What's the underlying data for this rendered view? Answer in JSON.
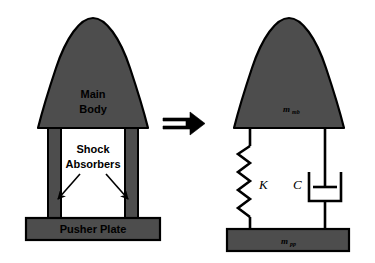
{
  "figure": {
    "background_color": "#ffffff",
    "body_fill_color": "#4d4d4d",
    "outline_color": "#000000"
  },
  "left_schematic": {
    "name": "physical-configuration",
    "main_body_label_line1": "Main",
    "main_body_label_line2": "Body",
    "shock_absorbers_label_line1": "Shock",
    "shock_absorbers_label_line2": "Absorbers",
    "pusher_plate_label": "Pusher Plate",
    "leg_count": 2,
    "arrow_count": 2
  },
  "equivalence": {
    "name": "implies-arrow",
    "symbol": "⇒"
  },
  "right_schematic": {
    "name": "lumped-mass-model",
    "main_body_mass_symbol": "m",
    "main_body_mass_subscript": "mb",
    "pusher_plate_mass_symbol": "m",
    "pusher_plate_mass_subscript": "pp",
    "spring_label": "K",
    "damper_label": "C",
    "spring_zigzag_count": 5
  }
}
